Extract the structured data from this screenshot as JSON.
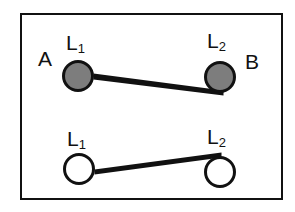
{
  "figure": {
    "type": "schematic-diagram",
    "frame": {
      "present": true,
      "border_color": "#111111",
      "background_color": "#ffffff"
    },
    "colors": {
      "outline": "#111111",
      "filled_node_fill": "#7d7d7d",
      "open_node_fill": "#ffffff",
      "connector": "#111111",
      "background": "#ffffff"
    },
    "side_labels": {
      "left": "A",
      "right": "B"
    },
    "rows": [
      {
        "name": "top-row",
        "node_style": "filled",
        "nodes": [
          {
            "label_text": "L",
            "label_sub": "1",
            "cx": 78,
            "cy": 76,
            "r": 15.5
          },
          {
            "label_text": "L",
            "label_sub": "2",
            "cx": 220,
            "cy": 77,
            "r": 15.5
          }
        ],
        "connector": {
          "x1": 94,
          "y1": 77,
          "x2": 223,
          "y2": 93,
          "slope": "downward"
        }
      },
      {
        "name": "bottom-row",
        "node_style": "open",
        "nodes": [
          {
            "label_text": "L",
            "label_sub": "1",
            "cx": 79,
            "cy": 169,
            "r": 15.5
          },
          {
            "label_text": "L",
            "label_sub": "2",
            "cx": 220,
            "cy": 172,
            "r": 15.5
          }
        ],
        "connector": {
          "x1": 95,
          "y1": 172,
          "x2": 221,
          "y2": 155,
          "slope": "upward"
        }
      }
    ]
  }
}
